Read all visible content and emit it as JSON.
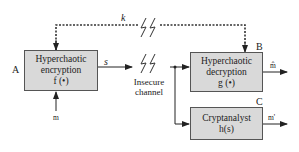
{
  "diagram": {
    "blocks": {
      "A": {
        "id_label": "A",
        "line1": "Hyperchaotic",
        "line2": "encryption",
        "line3": "f (•)"
      },
      "B": {
        "id_label": "B",
        "line1": "Hyperchaotic",
        "line2": "decryption",
        "line3": "g (•)"
      },
      "C": {
        "id_label": "C",
        "line1": "Cryptanalyst",
        "line2": "h(s)"
      }
    },
    "signals": {
      "key": "k",
      "ciphertext": "s",
      "input": "m",
      "output_b": "m̂",
      "output_c": "m'"
    },
    "channel": {
      "line1": "Insecure",
      "line2": "channel"
    },
    "colors": {
      "box_fill": "#d9d9d9",
      "line": "#222222"
    }
  }
}
